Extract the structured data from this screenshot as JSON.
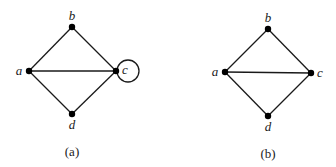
{
  "figures": [
    {
      "id": "a",
      "caption": "(a)",
      "vertices": [
        {
          "name": "a",
          "label": "a",
          "x": 29,
          "y": 71,
          "lx": 19,
          "ly": 75,
          "anchor": "middle"
        },
        {
          "name": "b",
          "label": "b",
          "x": 72,
          "y": 27,
          "lx": 72,
          "ly": 20,
          "anchor": "middle"
        },
        {
          "name": "c",
          "label": "c",
          "x": 116,
          "y": 71,
          "lx": 125,
          "ly": 74,
          "anchor": "middle"
        },
        {
          "name": "d",
          "label": "d",
          "x": 72,
          "y": 114,
          "lx": 72,
          "ly": 129,
          "anchor": "middle"
        }
      ],
      "edges": [
        [
          "a",
          "b"
        ],
        [
          "b",
          "c"
        ],
        [
          "a",
          "c"
        ],
        [
          "a",
          "d"
        ],
        [
          "d",
          "c"
        ]
      ],
      "loops": [
        {
          "vertex": "c",
          "cx": 128,
          "cy": 71,
          "r": 11
        }
      ]
    },
    {
      "id": "b",
      "caption": "(b)",
      "vertices": [
        {
          "name": "a",
          "label": "a",
          "x": 225,
          "y": 72,
          "lx": 215,
          "ly": 76,
          "anchor": "middle"
        },
        {
          "name": "b",
          "label": "b",
          "x": 268,
          "y": 29,
          "lx": 268,
          "ly": 22,
          "anchor": "middle"
        },
        {
          "name": "c",
          "label": "c",
          "x": 311,
          "y": 73,
          "lx": 320,
          "ly": 77,
          "anchor": "middle"
        },
        {
          "name": "d",
          "label": "d",
          "x": 268,
          "y": 116,
          "lx": 268,
          "ly": 131,
          "anchor": "middle"
        }
      ],
      "edges": [
        [
          "a",
          "b"
        ],
        [
          "b",
          "c"
        ],
        [
          "a",
          "c"
        ],
        [
          "a",
          "d"
        ],
        [
          "d",
          "c"
        ]
      ],
      "loops": []
    }
  ],
  "captions": {
    "a": {
      "text": "(a)",
      "x": 72,
      "y": 156
    },
    "b": {
      "text": "(b)",
      "x": 268,
      "y": 158
    }
  }
}
